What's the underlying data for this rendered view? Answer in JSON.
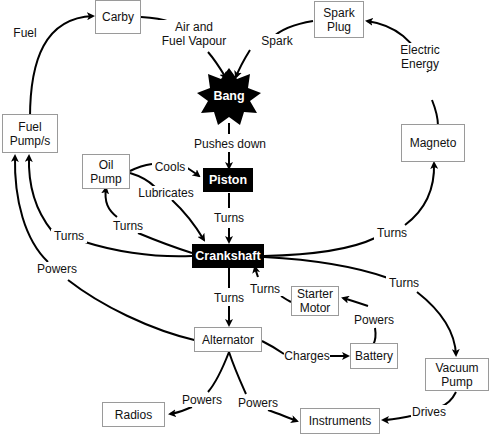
{
  "diagram": {
    "type": "concept-map",
    "nodes": [
      {
        "id": "carby",
        "label": "Carby",
        "style": "white"
      },
      {
        "id": "spark_plug",
        "label": "Spark\nPlug",
        "style": "white"
      },
      {
        "id": "bang",
        "label": "Bang",
        "style": "black-star"
      },
      {
        "id": "fuel_pump",
        "label": "Fuel\nPump/s",
        "style": "white"
      },
      {
        "id": "magneto",
        "label": "Magneto",
        "style": "white"
      },
      {
        "id": "oil_pump",
        "label": "Oil\nPump",
        "style": "white"
      },
      {
        "id": "piston",
        "label": "Piston",
        "style": "black"
      },
      {
        "id": "crankshaft",
        "label": "Crankshaft",
        "style": "black"
      },
      {
        "id": "starter_motor",
        "label": "Starter\nMotor",
        "style": "white"
      },
      {
        "id": "alternator",
        "label": "Alternator",
        "style": "white"
      },
      {
        "id": "battery",
        "label": "Battery",
        "style": "white"
      },
      {
        "id": "vacuum_pump",
        "label": "Vacuum\nPump",
        "style": "white"
      },
      {
        "id": "radios",
        "label": "Radios",
        "style": "white"
      },
      {
        "id": "instruments",
        "label": "Instruments",
        "style": "white"
      }
    ],
    "edges": [
      {
        "from": "fuel_pump",
        "to": "carby",
        "label": "Fuel"
      },
      {
        "from": "carby",
        "to": "bang",
        "label": "Air and\nFuel Vapour"
      },
      {
        "from": "spark_plug",
        "to": "bang",
        "label": "Spark"
      },
      {
        "from": "magneto",
        "to": "spark_plug",
        "label": "Electric\nEnergy"
      },
      {
        "from": "bang",
        "to": "piston",
        "label": "Pushes down"
      },
      {
        "from": "oil_pump",
        "to": "piston",
        "label": "Cools"
      },
      {
        "from": "oil_pump",
        "to": "crankshaft",
        "label": "Lubricates"
      },
      {
        "from": "piston",
        "to": "crankshaft",
        "label": "Turns"
      },
      {
        "from": "crankshaft",
        "to": "oil_pump",
        "label": "Turns"
      },
      {
        "from": "crankshaft",
        "to": "fuel_pump",
        "label": "Turns"
      },
      {
        "from": "alternator",
        "to": "fuel_pump",
        "label": "Powers"
      },
      {
        "from": "crankshaft",
        "to": "magneto",
        "label": "Turns"
      },
      {
        "from": "crankshaft",
        "to": "vacuum_pump",
        "label": "Turns"
      },
      {
        "from": "starter_motor",
        "to": "crankshaft",
        "label": "Turns"
      },
      {
        "from": "crankshaft",
        "to": "alternator",
        "label": "Turns"
      },
      {
        "from": "battery",
        "to": "starter_motor",
        "label": "Powers"
      },
      {
        "from": "alternator",
        "to": "battery",
        "label": "Charges"
      },
      {
        "from": "alternator",
        "to": "radios",
        "label": "Powers"
      },
      {
        "from": "alternator",
        "to": "instruments",
        "label": "Powers"
      },
      {
        "from": "vacuum_pump",
        "to": "instruments",
        "label": "Drives"
      }
    ]
  },
  "colors": {
    "line": "#000000",
    "box_border": "#9a9a9a",
    "dark_node": "#000000",
    "dark_text": "#ffffff"
  }
}
